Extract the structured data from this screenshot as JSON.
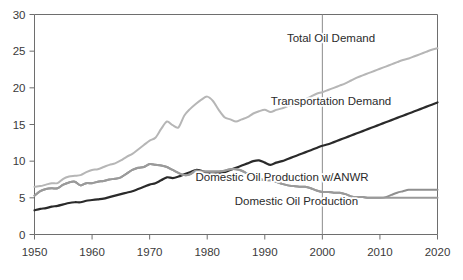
{
  "chart_data": {
    "type": "line",
    "title": "",
    "subtitle": "",
    "xlabel": "",
    "ylabel": "",
    "xlim": [
      1950,
      2020
    ],
    "ylim": [
      0,
      30
    ],
    "xticks": [
      1950,
      1960,
      1970,
      1980,
      1990,
      2000,
      2010,
      2020
    ],
    "xtick_labels": [
      "1950",
      "1960",
      "1970",
      "1980",
      "1990",
      "2000",
      "2010",
      "2020"
    ],
    "yticks": [
      0,
      5,
      10,
      15,
      20,
      25,
      30
    ],
    "ytick_labels": [
      "0",
      "5",
      "10",
      "15",
      "20",
      "25",
      "30"
    ],
    "grid": false,
    "legend_position": "inline-annotations",
    "annotations": [
      {
        "text": "Total Oil Demand",
        "x": 2001.5,
        "y": 26.2
      },
      {
        "text": "Transportation Demand",
        "x": 2001.5,
        "y": 17.6
      },
      {
        "text": "Domestic Oil Production w/ANWR",
        "x": 1993.0,
        "y": 7.3
      },
      {
        "text": "Domestic Oil Production",
        "x": 1995.5,
        "y": 4.0
      }
    ],
    "reference_lines": [
      {
        "orientation": "vertical",
        "x": 2000,
        "color": "#8c8c8c"
      }
    ],
    "series": [
      {
        "name": "Total Oil Demand",
        "color": "#b6b6b6",
        "width": 2.0,
        "x": [
          1950,
          1951,
          1952,
          1953,
          1954,
          1955,
          1956,
          1957,
          1958,
          1959,
          1960,
          1961,
          1962,
          1963,
          1964,
          1965,
          1966,
          1967,
          1968,
          1969,
          1970,
          1971,
          1972,
          1973,
          1974,
          1975,
          1976,
          1977,
          1978,
          1979,
          1980,
          1981,
          1982,
          1983,
          1984,
          1985,
          1986,
          1987,
          1988,
          1989,
          1990,
          1991,
          1992,
          1993,
          1994,
          1995,
          1996,
          1997,
          1998,
          1999,
          2000,
          2001,
          2002,
          2003,
          2004,
          2005,
          2006,
          2007,
          2008,
          2009,
          2010,
          2011,
          2012,
          2013,
          2014,
          2015,
          2016,
          2017,
          2018,
          2019,
          2020
        ],
        "y": [
          6.5,
          6.6,
          6.8,
          7.0,
          7.0,
          7.6,
          7.9,
          8.0,
          8.1,
          8.5,
          8.8,
          8.9,
          9.2,
          9.5,
          9.7,
          10.1,
          10.6,
          11.0,
          11.6,
          12.2,
          12.8,
          13.2,
          14.4,
          15.4,
          14.9,
          14.6,
          16.2,
          17.1,
          17.8,
          18.4,
          18.8,
          18.2,
          17.0,
          16.0,
          15.7,
          15.4,
          15.7,
          16.0,
          16.5,
          16.8,
          17.0,
          16.7,
          17.0,
          17.2,
          17.5,
          17.7,
          18.0,
          18.4,
          18.8,
          19.2,
          19.4,
          19.7,
          20.0,
          20.3,
          20.6,
          21.0,
          21.4,
          21.7,
          22.0,
          22.3,
          22.6,
          22.9,
          23.2,
          23.5,
          23.8,
          24.0,
          24.3,
          24.6,
          24.9,
          25.2,
          25.4
        ]
      },
      {
        "name": "Transportation Demand",
        "color": "#2a2a2a",
        "width": 2.2,
        "x": [
          1950,
          1951,
          1952,
          1953,
          1954,
          1955,
          1956,
          1957,
          1958,
          1959,
          1960,
          1961,
          1962,
          1963,
          1964,
          1965,
          1966,
          1967,
          1968,
          1969,
          1970,
          1971,
          1972,
          1973,
          1974,
          1975,
          1976,
          1977,
          1978,
          1979,
          1980,
          1981,
          1982,
          1983,
          1984,
          1985,
          1986,
          1987,
          1988,
          1989,
          1990,
          1991,
          1992,
          1993,
          1994,
          1995,
          1996,
          1997,
          1998,
          1999,
          2000,
          2001,
          2002,
          2003,
          2004,
          2005,
          2006,
          2007,
          2008,
          2009,
          2010,
          2011,
          2012,
          2013,
          2014,
          2015,
          2016,
          2017,
          2018,
          2019,
          2020
        ],
        "y": [
          3.3,
          3.5,
          3.6,
          3.8,
          3.9,
          4.1,
          4.3,
          4.4,
          4.4,
          4.6,
          4.7,
          4.8,
          4.9,
          5.1,
          5.3,
          5.5,
          5.7,
          5.9,
          6.2,
          6.5,
          6.8,
          7.0,
          7.4,
          7.8,
          7.7,
          7.9,
          8.2,
          8.5,
          8.8,
          8.7,
          8.4,
          8.3,
          8.4,
          8.5,
          8.8,
          9.1,
          9.4,
          9.7,
          10.0,
          10.1,
          9.8,
          9.5,
          9.8,
          10.0,
          10.3,
          10.6,
          10.9,
          11.2,
          11.5,
          11.8,
          12.1,
          12.3,
          12.6,
          12.9,
          13.2,
          13.5,
          13.8,
          14.1,
          14.4,
          14.7,
          15.0,
          15.3,
          15.6,
          15.9,
          16.2,
          16.5,
          16.8,
          17.1,
          17.4,
          17.7,
          18.0
        ]
      },
      {
        "name": "Domestic Oil Production w/ANWR",
        "color": "#8f8f8f",
        "width": 2.0,
        "x": [
          1950,
          1951,
          1952,
          1953,
          1954,
          1955,
          1956,
          1957,
          1958,
          1959,
          1960,
          1961,
          1962,
          1963,
          1964,
          1965,
          1966,
          1967,
          1968,
          1969,
          1970,
          1971,
          1972,
          1973,
          1974,
          1975,
          1976,
          1977,
          1978,
          1979,
          1980,
          1981,
          1982,
          1983,
          1984,
          1985,
          1986,
          1987,
          1988,
          1989,
          1990,
          1991,
          1992,
          1993,
          1994,
          1995,
          1996,
          1997,
          1998,
          1999,
          2000,
          2001,
          2002,
          2003,
          2004,
          2005,
          2006,
          2007,
          2008,
          2009,
          2010,
          2011,
          2012,
          2013,
          2014,
          2015,
          2016,
          2017,
          2018,
          2019,
          2020
        ],
        "y": [
          5.3,
          5.9,
          6.2,
          6.3,
          6.3,
          6.8,
          7.1,
          7.2,
          6.7,
          7.0,
          7.0,
          7.2,
          7.3,
          7.5,
          7.6,
          7.8,
          8.3,
          8.8,
          9.1,
          9.2,
          9.6,
          9.5,
          9.4,
          9.2,
          8.8,
          8.4,
          8.1,
          8.2,
          8.7,
          8.6,
          8.6,
          8.6,
          8.6,
          8.7,
          8.9,
          8.9,
          8.7,
          8.3,
          8.1,
          7.6,
          7.4,
          7.4,
          7.2,
          6.9,
          6.7,
          6.6,
          6.5,
          6.5,
          6.3,
          6.0,
          5.8,
          5.8,
          5.7,
          5.7,
          5.5,
          5.2,
          5.1,
          5.1,
          5.0,
          5.0,
          5.0,
          5.1,
          5.4,
          5.7,
          5.9,
          6.1,
          6.1,
          6.1,
          6.1,
          6.1,
          6.1
        ]
      },
      {
        "name": "Domestic Oil Production",
        "color": "#9a9a9a",
        "width": 2.0,
        "x": [
          1950,
          1951,
          1952,
          1953,
          1954,
          1955,
          1956,
          1957,
          1958,
          1959,
          1960,
          1961,
          1962,
          1963,
          1964,
          1965,
          1966,
          1967,
          1968,
          1969,
          1970,
          1971,
          1972,
          1973,
          1974,
          1975,
          1976,
          1977,
          1978,
          1979,
          1980,
          1981,
          1982,
          1983,
          1984,
          1985,
          1986,
          1987,
          1988,
          1989,
          1990,
          1991,
          1992,
          1993,
          1994,
          1995,
          1996,
          1997,
          1998,
          1999,
          2000,
          2001,
          2002,
          2003,
          2004,
          2005,
          2006,
          2007,
          2008,
          2009,
          2010,
          2011,
          2012,
          2013,
          2014,
          2015,
          2016,
          2017,
          2018,
          2019,
          2020
        ],
        "y": [
          5.3,
          5.9,
          6.2,
          6.3,
          6.3,
          6.8,
          7.1,
          7.2,
          6.7,
          7.0,
          7.0,
          7.2,
          7.3,
          7.5,
          7.6,
          7.8,
          8.3,
          8.8,
          9.1,
          9.2,
          9.6,
          9.5,
          9.4,
          9.2,
          8.8,
          8.4,
          8.1,
          8.2,
          8.7,
          8.6,
          8.6,
          8.6,
          8.6,
          8.7,
          8.9,
          8.9,
          8.7,
          8.3,
          8.1,
          7.6,
          7.4,
          7.4,
          7.2,
          6.9,
          6.7,
          6.6,
          6.5,
          6.5,
          6.3,
          6.0,
          5.8,
          5.8,
          5.7,
          5.7,
          5.5,
          5.2,
          5.1,
          5.1,
          5.0,
          5.0,
          5.0,
          5.0,
          5.0,
          5.0,
          5.0,
          5.0,
          5.0,
          5.0,
          5.0,
          5.0,
          5.0
        ]
      }
    ]
  },
  "colors": {
    "axis": "#6e6e6e",
    "text": "#3a3a3a",
    "background": "#ffffff",
    "reference_line": "#8c8c8c"
  }
}
